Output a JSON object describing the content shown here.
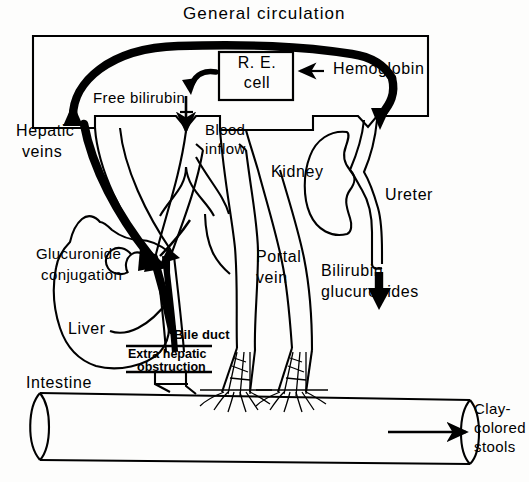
{
  "diagram": {
    "title": "General circulation",
    "domain_note": "Bilirubin metabolism with extra hepatic obstruction",
    "ink_color": "#000000",
    "paper_color": "#fdfdfc",
    "labels": {
      "general_circulation": "General circulation",
      "re_cell_line1": "R. E.",
      "re_cell_line2": "cell",
      "hemoglobin": "Hemoglobin",
      "hemoglobin_arrow": "←",
      "free_bilirubin": "Free bilirubin",
      "hepatic_veins_line1": "Hepatic",
      "hepatic_veins_line2": "veins",
      "blood_inflow_line1": "Blood",
      "blood_inflow_line2": "inflow",
      "kidney": "Kidney",
      "ureter": "Ureter",
      "portal_vein_line1": "Portal",
      "portal_vein_line2": "vein",
      "bilirubin_glucuronides_line1": "Bilirubin",
      "bilirubin_glucuronides_line2": "glucuronides",
      "glucuronide_conjugation_line1": "Glucuronide",
      "glucuronide_conjugation_line2": "conjugation",
      "liver": "Liver",
      "bile_duct": "Bile duct",
      "extra_hepatic_obstruction_line1": "Extra hepatic",
      "extra_hepatic_obstruction_line2": "obstruction",
      "intestine": "Intestine",
      "clay_colored_stools_line1": "Clay-",
      "clay_colored_stools_line2": "colored",
      "clay_colored_stools_line3": "stools"
    },
    "structures": [
      {
        "name": "general-circulation-compartment",
        "kind": "rectangle"
      },
      {
        "name": "re-cell-box",
        "kind": "rectangle"
      },
      {
        "name": "liver-outline",
        "kind": "organ"
      },
      {
        "name": "kidney-outline",
        "kind": "organ"
      },
      {
        "name": "intestine-tube",
        "kind": "organ"
      },
      {
        "name": "hepatic-vein-vessel",
        "kind": "vessel"
      },
      {
        "name": "portal-vein-vessel",
        "kind": "vessel"
      },
      {
        "name": "bile-duct-vessel",
        "kind": "vessel"
      },
      {
        "name": "ureter-vessel",
        "kind": "vessel"
      }
    ],
    "flow_arrows": [
      {
        "name": "free-bilirubin-to-circulation-arrow",
        "style": "thick"
      },
      {
        "name": "re-cell-to-free-bilirubin-arrow",
        "style": "thick-curved"
      },
      {
        "name": "hemoglobin-into-re-cell-arrow",
        "style": "thin"
      },
      {
        "name": "hemoglobin-to-kidney-arrow",
        "style": "thick"
      },
      {
        "name": "free-bilirubin-down-arrow",
        "style": "thin"
      },
      {
        "name": "circulation-to-liver-arrow",
        "style": "thick"
      },
      {
        "name": "bile-duct-backflow-arrow",
        "style": "thick"
      },
      {
        "name": "ureter-to-bilirubin-glucuronides-arrow",
        "style": "thick"
      },
      {
        "name": "intestine-to-stools-arrow",
        "style": "thin"
      }
    ]
  }
}
